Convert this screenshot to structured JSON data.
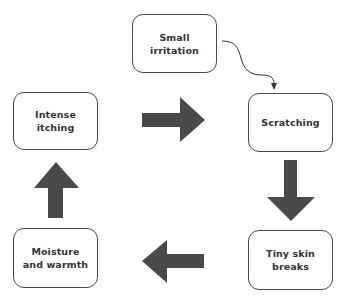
{
  "diagram": {
    "type": "cycle-flow",
    "colors": {
      "arrow": "#4a4a4a",
      "border": "#4a4a4a",
      "text": "#333333",
      "background": "#ffffff"
    },
    "nodes": {
      "small_irritation": {
        "label": "Small\nirritation"
      },
      "scratching": {
        "label": "Scratching"
      },
      "tiny_skin_breaks": {
        "label": "Tiny skin\nbreaks"
      },
      "moisture_warmth": {
        "label": "Moisture\nand warmth"
      },
      "intense_itching": {
        "label": "Intense\nitching"
      }
    },
    "edges": [
      {
        "from": "Small irritation",
        "to": "Scratching",
        "style": "thin curved arrow"
      },
      {
        "from": "Scratching",
        "to": "Tiny skin breaks",
        "style": "block arrow down"
      },
      {
        "from": "Tiny skin breaks",
        "to": "Moisture and warmth",
        "style": "block arrow left"
      },
      {
        "from": "Moisture and warmth",
        "to": "Intense itching",
        "style": "block arrow up"
      },
      {
        "from": "Intense itching",
        "to": "Scratching",
        "style": "block arrow right"
      }
    ]
  }
}
